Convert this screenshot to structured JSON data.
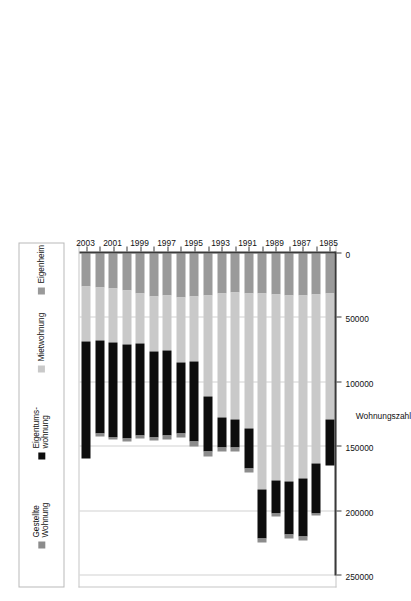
{
  "figure": {
    "rotation_degrees": -90,
    "background": "#ffffff"
  },
  "legend": {
    "position": "top",
    "items": [
      {
        "label": "Gestellte\nWohnung",
        "color": "#8c8c8c",
        "key": "gestellte-wohnung"
      },
      {
        "label": "Eigentums-\nwohnung",
        "color": "#0d0d0d",
        "key": "eigentumswohnung"
      },
      {
        "label": "Mietwohnung",
        "color": "#c9c9c9",
        "key": "mietwohnung"
      },
      {
        "label": "Eigenheim",
        "color": "#9a9a9a",
        "key": "eigenheim"
      }
    ]
  },
  "chart_data": {
    "type": "bar",
    "orientation": "horizontal-stacked",
    "title": "",
    "xlabel": "Wohnungszahl",
    "ylabel": "",
    "grid": true,
    "legend_position": "top",
    "value_axis": {
      "ticks": [
        0,
        50000,
        100000,
        150000,
        200000,
        250000
      ],
      "tick_labels": [
        "0",
        "50000",
        "100000",
        "150000",
        "200000",
        "250000"
      ],
      "lim": [
        0,
        250000
      ],
      "label": "Wohnungszahl"
    },
    "categories": [
      "1985",
      "1986",
      "1987",
      "1988",
      "1989",
      "1990",
      "1991",
      "1992",
      "1993",
      "1994",
      "1995",
      "1996",
      "1997",
      "1998",
      "1999",
      "2000",
      "2001",
      "2002",
      "2003"
    ],
    "category_tick_labels": [
      "1985",
      "1987",
      "1989",
      "1991",
      "1993",
      "1995",
      "1997",
      "1999",
      "2001",
      "2003"
    ],
    "series": [
      {
        "name": "Eigenheim",
        "color": "#9a9a9a",
        "values": [
          31000,
          31500,
          32500,
          32500,
          32000,
          31000,
          31000,
          30500,
          31000,
          32500,
          33000,
          34000,
          32500,
          33000,
          31000,
          29000,
          27500,
          26500,
          26000
        ]
      },
      {
        "name": "Mietwohnung",
        "color": "#c9c9c9",
        "values": [
          98000,
          131500,
          142500,
          144500,
          144500,
          152000,
          104500,
          98000,
          96500,
          78500,
          51000,
          51000,
          43000,
          43000,
          38500,
          41500,
          41500,
          41000,
          42000
        ]
      },
      {
        "name": "Eigentumswohnung",
        "color": "#0d0d0d",
        "values": [
          35500,
          38500,
          45000,
          41000,
          25500,
          38000,
          31500,
          22000,
          23000,
          43000,
          62000,
          54500,
          66000,
          66500,
          71500,
          73500,
          73500,
          72500,
          91000
        ]
      },
      {
        "name": "Gestellte Wohnung",
        "color": "#8c8c8c",
        "values": [
          0,
          2000,
          2500,
          3500,
          2000,
          3000,
          3000,
          3000,
          3500,
          3500,
          3500,
          3000,
          3000,
          2500,
          2500,
          2000,
          2000,
          2000,
          0
        ]
      }
    ]
  }
}
